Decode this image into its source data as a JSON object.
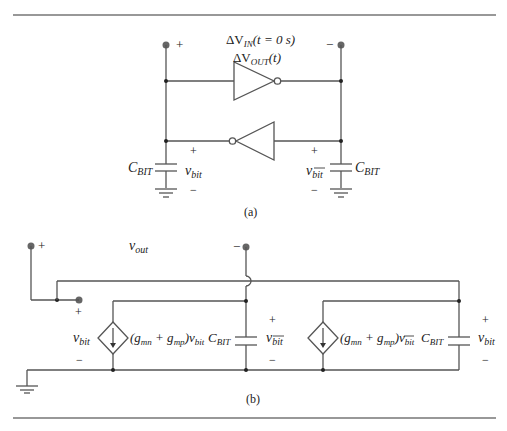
{
  "figure": {
    "part_a": {
      "caption": "(a)",
      "input_label_main": "ΔV",
      "input_label_sub": "IN",
      "input_label_tail": "(t = 0 s)",
      "output_label_main": "ΔV",
      "output_label_sub": "OUT",
      "output_label_tail": "(t)",
      "left_terminal_sign": "+",
      "right_terminal_sign": "−",
      "left_cap": {
        "label_main": "C",
        "label_sub": "BIT"
      },
      "right_cap": {
        "label_main": "C",
        "label_sub": "BIT"
      },
      "left_node": {
        "plus": "+",
        "minus": "−",
        "label_main": "v",
        "label_sub": "bit"
      },
      "right_node": {
        "plus": "+",
        "minus": "−",
        "label_main": "v",
        "label_sub": "bit",
        "overbar": true
      }
    },
    "part_b": {
      "caption": "(b)",
      "vout_main": "v",
      "vout_sub": "out",
      "left_terminal_sign": "+",
      "right_terminal_sign": "−",
      "inner_terminal_sign": "+",
      "left_vbit": {
        "main": "v",
        "sub": "bit",
        "minus": "−"
      },
      "source1": {
        "expr_open": "(g",
        "s1": "mn",
        "plus": " + g",
        "s2": "mp",
        "close": ")v",
        "s3": "bit"
      },
      "cap1": {
        "label_main": "C",
        "label_sub": "BIT",
        "plus": "+",
        "minus": "−",
        "v_main": "v",
        "v_sub": "bit",
        "overbar": true
      },
      "source2": {
        "expr_open": "(g",
        "s1": "mn",
        "plus": " + g",
        "s2": "mp",
        "close": ")v",
        "s3": "bit",
        "overbar": true
      },
      "cap2": {
        "label_main": "C",
        "label_sub": "BIT",
        "plus": "+",
        "minus": "−",
        "v_main": "v",
        "v_sub": "bit"
      }
    }
  }
}
